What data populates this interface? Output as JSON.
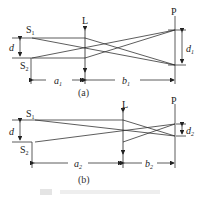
{
  "panel_a": {
    "source_top": "S",
    "source_top_sub": "1",
    "source_bottom": "S",
    "source_bottom_sub": "2",
    "lens": "L",
    "screen": "P",
    "separation": "d",
    "image_separation": "d",
    "image_separation_sub": "1",
    "object_distance": "a",
    "object_distance_sub": "1",
    "image_distance": "b",
    "image_distance_sub": "1",
    "caption": "(a)"
  },
  "panel_b": {
    "source_top": "S",
    "source_top_sub": "1",
    "source_bottom": "S",
    "source_bottom_sub": "2",
    "lens": "L",
    "screen": "P",
    "separation": "d",
    "image_separation": "d",
    "image_separation_sub": "2",
    "object_distance": "a",
    "object_distance_sub": "2",
    "image_distance": "b",
    "image_distance_sub": "2",
    "caption": "(b)"
  },
  "figure_caption": "图"
}
